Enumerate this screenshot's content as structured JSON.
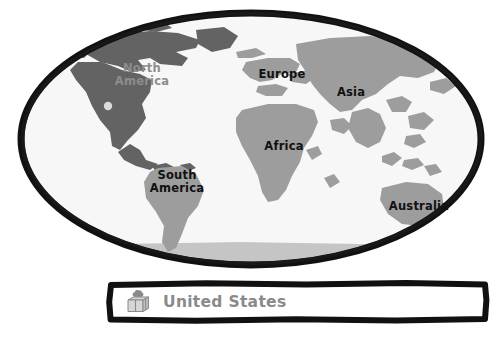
{
  "map": {
    "ocean_color": "#f7f7f7",
    "outline_color": "#111111",
    "land_color": "#9d9d9d",
    "highlight_color": "#636363",
    "marker_color": "#d9d9d9",
    "continents": [
      {
        "id": "north-america",
        "label": "North\nAmerica",
        "style": "faded",
        "highlighted": true
      },
      {
        "id": "south-america",
        "label": "South\nAmerica",
        "style": "dark",
        "highlighted": false
      },
      {
        "id": "europe",
        "label": "Europe",
        "style": "dark",
        "highlighted": false
      },
      {
        "id": "africa",
        "label": "Africa",
        "style": "dark",
        "highlighted": false
      },
      {
        "id": "asia",
        "label": "Asia",
        "style": "dark",
        "highlighted": false
      },
      {
        "id": "australia",
        "label": "Australia",
        "style": "dark",
        "highlighted": false
      }
    ]
  },
  "panel": {
    "label": "United States",
    "icon": "gift-box-icon",
    "text_color": "#8a8a8a",
    "border_color": "#111111",
    "background_color": "#ffffff"
  }
}
